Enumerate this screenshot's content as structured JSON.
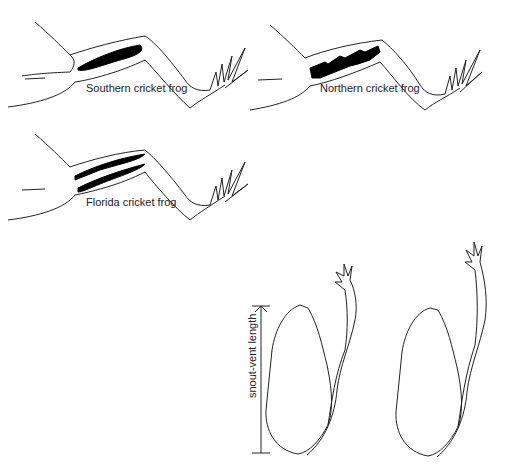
{
  "diagram": {
    "panels": [
      {
        "id": "southern",
        "label": "Southern cricket frog",
        "pattern": "solid-stripe"
      },
      {
        "id": "northern",
        "label": "Northern cricket frog",
        "pattern": "ragged-stripe"
      },
      {
        "id": "florida",
        "label": "Florida cricket frog",
        "pattern": "double-stripe"
      }
    ],
    "measurement": {
      "label": "snout-vent length"
    },
    "colors": {
      "line": "#222222",
      "fill": "#000000",
      "background": "#ffffff"
    }
  }
}
